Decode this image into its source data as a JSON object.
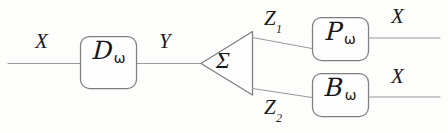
{
  "diagram": {
    "background_color": "#fdfdfc",
    "stroke_color": "#8a8a8a",
    "text_color": "#17171a",
    "edge_labels": {
      "input_x": "X",
      "mid_y": "Y",
      "branch_z1_base": "Z",
      "branch_z1_sub": "1",
      "branch_z2_base": "Z",
      "branch_z2_sub": "2",
      "output_x_top": "X",
      "output_x_bottom": "X"
    },
    "nodes": {
      "decoder": {
        "symbol": "D",
        "subscript": "ω"
      },
      "summer": {
        "symbol": "Σ"
      },
      "predictor": {
        "symbol": "P",
        "subscript": "ω"
      },
      "backward": {
        "symbol": "B",
        "subscript": "ω"
      }
    }
  }
}
